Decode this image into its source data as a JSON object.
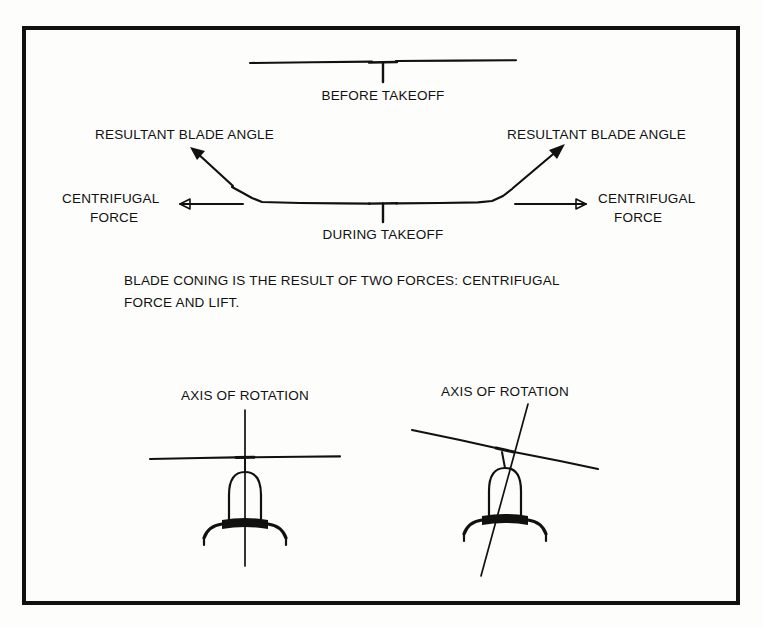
{
  "figure": {
    "kind": "technical-illustration",
    "background_color": "#fdfdfb",
    "ink_color": "#111111",
    "border": {
      "name": "figure-border",
      "color": "#111111",
      "thickness_px": 4,
      "x": 22,
      "y": 26,
      "width": 718,
      "height": 579
    }
  },
  "panels": {
    "before_takeoff": {
      "label": "BEFORE TAKEOFF",
      "mast_symbol": "T",
      "rotor_line": {
        "left_x": 250,
        "right_x": 516,
        "y": 62,
        "state": "flat"
      }
    },
    "during_takeoff": {
      "label": "DURING TAKEOFF",
      "mast_symbol": "T",
      "rotor_line": {
        "left_x": 248,
        "right_x": 520,
        "y": 203,
        "state": "coned"
      },
      "labels": {
        "resultant_blade_angle_left": "RESULTANT BLADE ANGLE",
        "resultant_blade_angle_right": "RESULTANT BLADE ANGLE",
        "centrifugal_force_left_line1": "CENTRIFUGAL",
        "centrifugal_force_left_line2": "FORCE",
        "centrifugal_force_right_line1": "CENTRIFUGAL",
        "centrifugal_force_right_line2": "FORCE"
      }
    }
  },
  "caption": {
    "line1": "BLADE CONING IS THE RESULT OF TWO FORCES: CENTRIFUGAL",
    "line2": "FORCE AND LIFT."
  },
  "lower_panels": {
    "left": {
      "label": "AXIS OF ROTATION",
      "state": "vertical-axis",
      "tilt_degrees": 0,
      "center_x": 245,
      "rotor_y": 457
    },
    "right": {
      "label": "AXIS OF ROTATION",
      "state": "tilted-axis",
      "tilt_degrees": 9,
      "center_x": 505,
      "rotor_y": 450
    }
  },
  "icons": {
    "arrow_head": "arrowhead-icon",
    "mast": "mast-t-icon",
    "fuselage": "fuselage-icon",
    "skid": "landing-skid-icon"
  }
}
